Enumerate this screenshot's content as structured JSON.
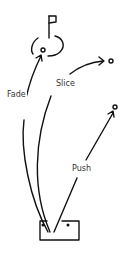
{
  "diagram": {
    "labels": {
      "fade": "Fade",
      "slice": "Slice",
      "push": "Push"
    },
    "elements": [
      "flag",
      "green-circle",
      "target-ball-fade",
      "target-ball-slice",
      "target-ball-push",
      "tee-box"
    ],
    "colors": {
      "stroke": "#111111",
      "label": "#333333",
      "background": "#ffffff"
    }
  }
}
